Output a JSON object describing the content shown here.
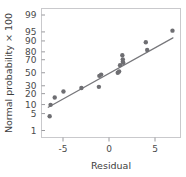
{
  "chart_data": {
    "type": "scatter",
    "title": "",
    "xlabel": "Residual",
    "ylabel": "Normal probability × 100",
    "xlim": [
      -7.6,
      7.7
    ],
    "ylim_probit": [
      0.7,
      99.3
    ],
    "grid": false,
    "legend": null,
    "y_scale": "normal-probability (probit)",
    "y_ticks": [
      1,
      5,
      10,
      20,
      30,
      50,
      70,
      80,
      90,
      95,
      99
    ],
    "y_tick_labels": [
      "1",
      "5",
      "10",
      "20",
      "30",
      "50",
      "70",
      "80",
      "90",
      "95",
      "99"
    ],
    "x_ticks": [
      -5,
      0,
      5
    ],
    "x_tick_labels": [
      "-5",
      "0",
      "5"
    ],
    "series": [
      {
        "name": "residual-points",
        "marker": "circle",
        "color": "#6e6e72",
        "points": [
          {
            "x": -6.45,
            "y": 4.0
          },
          {
            "x": -6.35,
            "y": 9.8
          },
          {
            "x": -5.9,
            "y": 16.0
          },
          {
            "x": -4.95,
            "y": 22.5
          },
          {
            "x": -3.0,
            "y": 27.0
          },
          {
            "x": -1.1,
            "y": 28.5
          },
          {
            "x": -1.05,
            "y": 45.0
          },
          {
            "x": -0.85,
            "y": 47.0
          },
          {
            "x": 0.95,
            "y": 50.0
          },
          {
            "x": 1.1,
            "y": 52.0
          },
          {
            "x": 1.45,
            "y": 76.0
          },
          {
            "x": 1.5,
            "y": 70.5
          },
          {
            "x": 1.5,
            "y": 67.0
          },
          {
            "x": 1.55,
            "y": 65.5
          },
          {
            "x": 1.2,
            "y": 62.0
          },
          {
            "x": 4.0,
            "y": 89.0
          },
          {
            "x": 4.15,
            "y": 82.0
          },
          {
            "x": 6.9,
            "y": 95.5
          }
        ]
      }
    ],
    "fit_line": {
      "name": "reference-line",
      "color": "#77777b",
      "from": {
        "x": -6.6,
        "y": 8.2
      },
      "to": {
        "x": 6.95,
        "y": 92.0
      }
    }
  }
}
